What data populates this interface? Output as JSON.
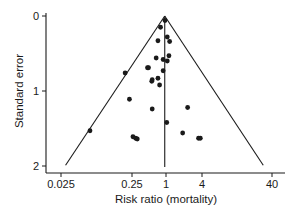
{
  "chart_data": {
    "type": "scatter",
    "subtype": "funnel_plot",
    "title": "",
    "xlabel": "Risk ratio (mortality)",
    "ylabel": "Standard error",
    "x_scale": "log",
    "x_ticks": [
      {
        "value": 0.025,
        "label": "0.025",
        "px": 61
      },
      {
        "value": 0.25,
        "label": "0.25",
        "px": 132
      },
      {
        "value": 1,
        "label": "1",
        "px": 166
      },
      {
        "value": 4,
        "label": "4",
        "px": 202
      },
      {
        "value": 40,
        "label": "40",
        "px": 272
      }
    ],
    "y_ticks": [
      {
        "value": 0,
        "label": "0",
        "px": 16
      },
      {
        "value": 1,
        "label": "1",
        "px": 91
      },
      {
        "value": 2,
        "label": "2",
        "px": 166
      }
    ],
    "ylim": [
      2,
      0
    ],
    "y_inverted": true,
    "grid": false,
    "legend": null,
    "reference_line": {
      "x": 0.95,
      "label": "pooled estimate"
    },
    "funnel": {
      "apex": {
        "rr": 0.95,
        "se": 0.0
      },
      "left_bottom": {
        "rr": 0.029,
        "se": 1.99
      },
      "right_bottom": {
        "rr": 30,
        "se": 1.99
      }
    },
    "points": [
      {
        "rr": 0.96,
        "se": 0.06
      },
      {
        "rr": 0.8,
        "se": 0.15
      },
      {
        "rr": 1.05,
        "se": 0.28
      },
      {
        "rr": 1.15,
        "se": 0.34
      },
      {
        "rr": 0.72,
        "se": 0.33
      },
      {
        "rr": 1.12,
        "se": 0.53
      },
      {
        "rr": 0.67,
        "se": 0.56
      },
      {
        "rr": 0.89,
        "se": 0.58
      },
      {
        "rr": 1.05,
        "se": 0.6
      },
      {
        "rr": 0.47,
        "se": 0.69
      },
      {
        "rr": 0.49,
        "se": 0.69
      },
      {
        "rr": 0.89,
        "se": 0.73
      },
      {
        "rr": 0.2,
        "se": 0.76
      },
      {
        "rr": 0.72,
        "se": 0.83
      },
      {
        "rr": 0.57,
        "se": 0.85
      },
      {
        "rr": 0.56,
        "se": 0.87
      },
      {
        "rr": 0.77,
        "se": 0.92
      },
      {
        "rr": 0.23,
        "se": 1.11
      },
      {
        "rr": 0.57,
        "se": 1.24
      },
      {
        "rr": 2.3,
        "se": 1.22
      },
      {
        "rr": 1.03,
        "se": 1.42
      },
      {
        "rr": 0.064,
        "se": 1.53
      },
      {
        "rr": 1.9,
        "se": 1.56
      },
      {
        "rr": 0.26,
        "se": 1.61
      },
      {
        "rr": 0.29,
        "se": 1.63
      },
      {
        "rr": 0.31,
        "se": 1.64
      },
      {
        "rr": 3.5,
        "se": 1.63
      },
      {
        "rr": 3.75,
        "se": 1.63
      }
    ]
  },
  "colors": {
    "ink": "#1a1a1a",
    "background": "#ffffff"
  }
}
